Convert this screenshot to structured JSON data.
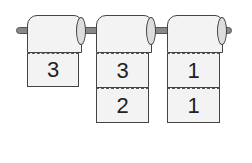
{
  "rolls": [
    {
      "sheets": [
        "3"
      ]
    },
    {
      "sheets": [
        "3",
        "2"
      ]
    },
    {
      "sheets": [
        "1",
        "1"
      ]
    }
  ]
}
